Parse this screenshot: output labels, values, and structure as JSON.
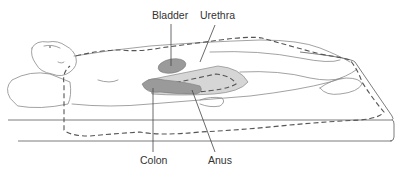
{
  "figure": {
    "labels": {
      "bladder": "Bladder",
      "urethra": "Urethra",
      "colon": "Colon",
      "anus": "Anus"
    },
    "colors": {
      "line": "#8a8a8a",
      "dashed_outline": "#555555",
      "organ_fill": "#9a9a9a",
      "pad_fill": "#d6d6d6",
      "text": "#333333"
    }
  }
}
